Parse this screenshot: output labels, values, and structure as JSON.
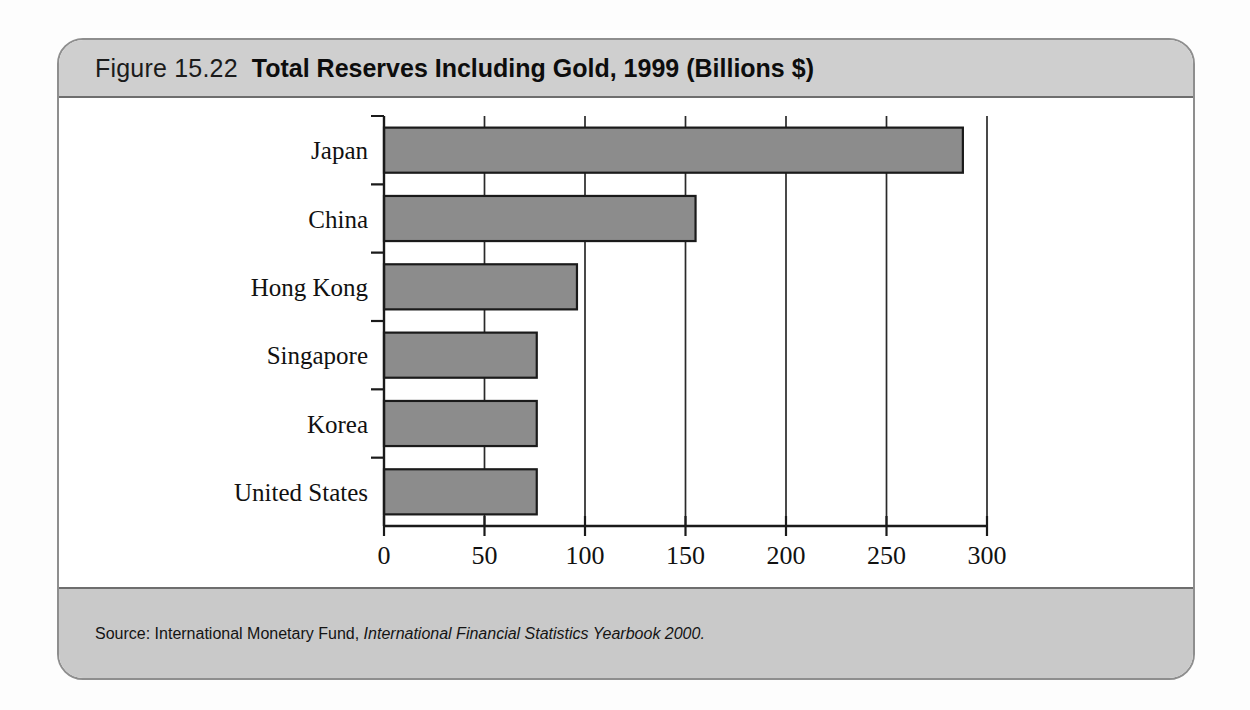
{
  "figure": {
    "number": "Figure 15.22",
    "title": "Total Reserves Including Gold, 1999 (Billions $)",
    "source_prefix": "Source: International Monetary Fund,",
    "source_publication": "International Financial Statistics Yearbook 2000."
  },
  "colors": {
    "bar_fill": "#8c8c8c",
    "bar_stroke": "#1a1a1a",
    "header_band": "#cfcfcf",
    "source_band": "#c9c9c9",
    "card_border": "#8e8e8e",
    "plot_background": "#ffffff"
  },
  "chart_data": {
    "type": "bar",
    "orientation": "horizontal",
    "title": "Total Reserves Including Gold, 1999 (Billions $)",
    "categories": [
      "Japan",
      "China",
      "Hong Kong",
      "Singapore",
      "Korea",
      "United States"
    ],
    "values": [
      288,
      155,
      96,
      76,
      76,
      76
    ],
    "xlabel": "Billions $",
    "ylabel": "",
    "xlim": [
      0,
      300
    ],
    "xticks": [
      0,
      50,
      100,
      150,
      200,
      250,
      300
    ],
    "xtick_labels": [
      "0",
      "50",
      "100",
      "150",
      "200",
      "250",
      "300"
    ],
    "grid": "vertical",
    "legend": "none"
  }
}
